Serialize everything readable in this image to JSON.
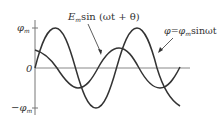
{
  "diagram": {
    "type": "waveform",
    "axis_labels": {
      "y_max": "φ",
      "y_max_sub": "m",
      "zero": "0",
      "y_min": "−φ",
      "y_min_sub": "m"
    },
    "curves": [
      {
        "name": "emf",
        "label_main": "E",
        "label_sub": "m",
        "label_rest": "sin (ωt + θ)",
        "amplitude_px": 20,
        "note": "smaller amplitude, phase-leading curve"
      },
      {
        "name": "flux",
        "label_main": "φ=φ",
        "label_sub": "m",
        "label_rest": "sinωt",
        "amplitude_px": 40,
        "note": "larger amplitude sine curve starting at origin"
      }
    ],
    "colors": {
      "curve": "#333333",
      "axis": "#777777",
      "text": "#333333"
    }
  }
}
